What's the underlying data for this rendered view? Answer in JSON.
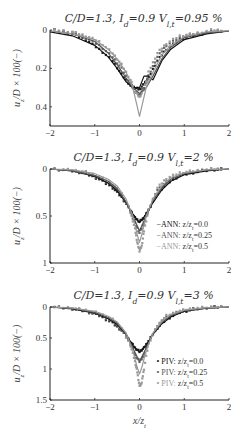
{
  "chart_data": [
    {
      "type": "line",
      "title": "C/D=1.3, I_d=0.9 V_l,t=0.95 %",
      "xlabel": "",
      "ylabel": "u_z/D × 100(−)",
      "xlim": [
        -2,
        2
      ],
      "ylim": [
        0,
        0.5
      ],
      "y_inverted": true,
      "xticks": [
        "-2",
        "-1",
        "0",
        "1",
        "2"
      ],
      "yticks": [
        "0",
        "0.2",
        "0.4"
      ],
      "ytick_values": [
        0,
        0.2,
        0.4
      ],
      "legend": [],
      "series": [
        {
          "name": "ANN: z/z_t=0.0",
          "style": "line",
          "color": "#111111",
          "x": [
            -2,
            -1.5,
            -1,
            -0.7,
            -0.5,
            -0.3,
            -0.15,
            0,
            0.1,
            0.2,
            0.3,
            0.5,
            0.7,
            1,
            1.5,
            2
          ],
          "y": [
            0.01,
            0.03,
            0.08,
            0.14,
            0.2,
            0.27,
            0.3,
            0.3,
            0.24,
            0.24,
            0.26,
            0.16,
            0.1,
            0.05,
            0.02,
            0.005
          ]
        },
        {
          "name": "ANN: z/z_t=0.25",
          "style": "line",
          "color": "#555555",
          "x": [
            -2,
            -1.5,
            -1,
            -0.7,
            -0.5,
            -0.3,
            -0.15,
            0,
            0.15,
            0.3,
            0.5,
            0.7,
            1,
            1.5,
            2
          ],
          "y": [
            0.005,
            0.02,
            0.06,
            0.12,
            0.18,
            0.25,
            0.3,
            0.33,
            0.3,
            0.24,
            0.15,
            0.09,
            0.04,
            0.015,
            0.005
          ]
        },
        {
          "name": "ANN: z/z_t=0.5",
          "style": "line",
          "color": "#999999",
          "x": [
            -2,
            -1.5,
            -1,
            -0.7,
            -0.5,
            -0.3,
            -0.15,
            -0.05,
            0,
            0.05,
            0.15,
            0.3,
            0.5,
            0.7,
            1,
            1.5,
            2
          ],
          "y": [
            0.005,
            0.02,
            0.05,
            0.1,
            0.15,
            0.22,
            0.3,
            0.4,
            0.45,
            0.4,
            0.3,
            0.22,
            0.13,
            0.08,
            0.035,
            0.01,
            0.003
          ]
        },
        {
          "name": "PIV: z/z_t=0.0",
          "style": "marker",
          "color": "#222222",
          "x": [
            -1.9,
            -1.5,
            -1.2,
            -0.9,
            -0.6,
            -0.4,
            -0.2,
            -0.1,
            0,
            0.1,
            0.2,
            0.4,
            0.6,
            0.9,
            1.2,
            1.6,
            1.9
          ],
          "y": [
            0.0,
            0.02,
            0.05,
            0.1,
            0.16,
            0.23,
            0.29,
            0.3,
            0.31,
            0.28,
            0.25,
            0.16,
            0.1,
            0.05,
            0.03,
            0.01,
            0.0
          ]
        },
        {
          "name": "PIV: z/z_t=0.25",
          "style": "marker",
          "color": "#666666",
          "x": [
            -1.9,
            -1.5,
            -1.2,
            -0.9,
            -0.6,
            -0.4,
            -0.2,
            -0.1,
            0,
            0.1,
            0.2,
            0.4,
            0.6,
            0.9,
            1.2,
            1.6,
            1.9
          ],
          "y": [
            0.0,
            0.01,
            0.04,
            0.08,
            0.14,
            0.2,
            0.28,
            0.32,
            0.34,
            0.3,
            0.24,
            0.14,
            0.08,
            0.04,
            0.02,
            0.01,
            0.0
          ]
        },
        {
          "name": "PIV: z/z_t=0.5",
          "style": "marker",
          "color": "#9a9a9a",
          "x": [
            -1.9,
            -1.5,
            -1.2,
            -0.9,
            -0.6,
            -0.4,
            -0.2,
            -0.1,
            0,
            0.1,
            0.2,
            0.4,
            0.6,
            0.9,
            1.2,
            1.6,
            1.9
          ],
          "y": [
            0.0,
            0.01,
            0.03,
            0.06,
            0.12,
            0.18,
            0.26,
            0.32,
            0.35,
            0.31,
            0.22,
            0.12,
            0.07,
            0.03,
            0.02,
            0.0,
            0.0
          ]
        }
      ]
    },
    {
      "type": "line",
      "title": "C/D=1.3, I_d=0.9 V_l,t=2 %",
      "xlabel": "",
      "ylabel": "u_z/D × 100(−)",
      "xlim": [
        -2,
        2
      ],
      "ylim": [
        0,
        1
      ],
      "y_inverted": true,
      "xticks": [
        "-2",
        "-1",
        "0",
        "1",
        "2"
      ],
      "yticks": [
        "0",
        "0.5",
        "1"
      ],
      "ytick_values": [
        0,
        0.5,
        1
      ],
      "legend": [
        "ANN: z/z_t=0.0",
        "ANN: z/z_t=0.25",
        "ANN: z/z_t=0.5"
      ],
      "series": [
        {
          "name": "ANN: z/z_t=0.0",
          "style": "line",
          "color": "#111111",
          "x": [
            -2,
            -1.5,
            -1,
            -0.7,
            -0.5,
            -0.3,
            -0.15,
            0,
            0.15,
            0.3,
            0.5,
            0.7,
            1,
            1.5,
            2
          ],
          "y": [
            0.0,
            0.02,
            0.08,
            0.15,
            0.23,
            0.36,
            0.48,
            0.57,
            0.48,
            0.36,
            0.22,
            0.13,
            0.06,
            0.02,
            0.0
          ]
        },
        {
          "name": "ANN: z/z_t=0.25",
          "style": "line",
          "color": "#555555",
          "x": [
            -2,
            -1.5,
            -1,
            -0.7,
            -0.5,
            -0.3,
            -0.15,
            0,
            0.15,
            0.3,
            0.5,
            0.7,
            1,
            1.5,
            2
          ],
          "y": [
            0.0,
            0.02,
            0.07,
            0.13,
            0.21,
            0.35,
            0.5,
            0.66,
            0.5,
            0.34,
            0.2,
            0.11,
            0.05,
            0.01,
            0.0
          ]
        },
        {
          "name": "ANN: z/z_t=0.5",
          "style": "line",
          "color": "#999999",
          "x": [
            -2,
            -1.5,
            -1,
            -0.7,
            -0.5,
            -0.3,
            -0.15,
            -0.05,
            0,
            0.05,
            0.15,
            0.3,
            0.5,
            0.7,
            1,
            1.5,
            2
          ],
          "y": [
            0.0,
            0.01,
            0.05,
            0.11,
            0.18,
            0.32,
            0.5,
            0.7,
            0.78,
            0.7,
            0.5,
            0.32,
            0.18,
            0.09,
            0.04,
            0.01,
            0.0
          ]
        },
        {
          "name": "PIV: z/z_t=0.0",
          "style": "marker",
          "color": "#222222",
          "x": [
            -1.9,
            -1.5,
            -1.2,
            -0.9,
            -0.6,
            -0.4,
            -0.2,
            -0.1,
            0,
            0.1,
            0.2,
            0.4,
            0.6,
            0.9,
            1.2,
            1.6,
            1.9
          ],
          "y": [
            0.0,
            0.02,
            0.05,
            0.11,
            0.2,
            0.3,
            0.44,
            0.52,
            0.56,
            0.52,
            0.44,
            0.26,
            0.16,
            0.07,
            0.04,
            0.01,
            0.0
          ]
        },
        {
          "name": "PIV: z/z_t=0.25",
          "style": "marker",
          "color": "#666666",
          "x": [
            -1.9,
            -1.5,
            -1.2,
            -0.9,
            -0.6,
            -0.4,
            -0.2,
            -0.1,
            0,
            0.1,
            0.2,
            0.4,
            0.6,
            0.9,
            1.2,
            1.6,
            1.9
          ],
          "y": [
            0.0,
            0.02,
            0.04,
            0.1,
            0.18,
            0.28,
            0.46,
            0.58,
            0.68,
            0.58,
            0.44,
            0.22,
            0.14,
            0.06,
            0.03,
            0.0,
            0.0
          ]
        },
        {
          "name": "PIV: z/z_t=0.5",
          "style": "marker",
          "color": "#9a9a9a",
          "x": [
            -1.9,
            -1.5,
            -1.2,
            -0.9,
            -0.6,
            -0.4,
            -0.2,
            -0.1,
            -0.05,
            0,
            0.05,
            0.1,
            0.2,
            0.4,
            0.6,
            0.9,
            1.2,
            1.6,
            1.9
          ],
          "y": [
            0.0,
            0.01,
            0.03,
            0.08,
            0.16,
            0.26,
            0.46,
            0.64,
            0.78,
            0.87,
            0.82,
            0.66,
            0.44,
            0.2,
            0.1,
            0.04,
            0.02,
            0.0,
            0.0
          ]
        }
      ]
    },
    {
      "type": "line",
      "title": "C/D=1.3, I_d=0.9 V_l,t=3 %",
      "xlabel": "x/z_t",
      "ylabel": "u_z/D × 100(−)",
      "xlim": [
        -2,
        2
      ],
      "ylim": [
        0,
        1.5
      ],
      "y_inverted": true,
      "xticks": [
        "-2",
        "-1",
        "0",
        "1",
        "2"
      ],
      "yticks": [
        "0",
        "0.5",
        "1",
        "1.5"
      ],
      "ytick_values": [
        0,
        0.5,
        1,
        1.5
      ],
      "legend": [
        "PIV: z/z_t=0.0",
        "PIV: z/z_t=0.25",
        "PIV: z/z_t=0.5"
      ],
      "series": [
        {
          "name": "ANN: z/z_t=0.0",
          "style": "line",
          "color": "#111111",
          "x": [
            -2,
            -1.5,
            -1,
            -0.7,
            -0.5,
            -0.3,
            -0.15,
            0,
            0.15,
            0.3,
            0.5,
            0.7,
            1,
            1.5,
            2
          ],
          "y": [
            0.0,
            0.03,
            0.1,
            0.19,
            0.28,
            0.44,
            0.62,
            0.73,
            0.62,
            0.44,
            0.27,
            0.16,
            0.07,
            0.02,
            0.0
          ]
        },
        {
          "name": "ANN: z/z_t=0.25",
          "style": "line",
          "color": "#555555",
          "x": [
            -2,
            -1.5,
            -1,
            -0.7,
            -0.5,
            -0.3,
            -0.15,
            0,
            0.15,
            0.3,
            0.5,
            0.7,
            1,
            1.5,
            2
          ],
          "y": [
            0.0,
            0.02,
            0.09,
            0.17,
            0.26,
            0.43,
            0.66,
            0.88,
            0.66,
            0.43,
            0.25,
            0.14,
            0.06,
            0.02,
            0.0
          ]
        },
        {
          "name": "ANN: z/z_t=0.5",
          "style": "line",
          "color": "#999999",
          "x": [
            -2,
            -1.5,
            -1,
            -0.7,
            -0.5,
            -0.3,
            -0.15,
            -0.05,
            0,
            0.05,
            0.15,
            0.3,
            0.5,
            0.7,
            1,
            1.5,
            2
          ],
          "y": [
            0.0,
            0.02,
            0.07,
            0.15,
            0.24,
            0.42,
            0.7,
            0.98,
            1.08,
            0.98,
            0.7,
            0.42,
            0.23,
            0.12,
            0.05,
            0.01,
            0.0
          ]
        },
        {
          "name": "PIV: z/z_t=0.0",
          "style": "marker",
          "color": "#222222",
          "x": [
            -1.9,
            -1.5,
            -1.2,
            -0.9,
            -0.6,
            -0.4,
            -0.2,
            -0.1,
            0,
            0.1,
            0.2,
            0.4,
            0.6,
            0.9,
            1.2,
            1.6,
            1.9
          ],
          "y": [
            0.0,
            0.03,
            0.07,
            0.14,
            0.26,
            0.38,
            0.56,
            0.66,
            0.72,
            0.66,
            0.55,
            0.34,
            0.2,
            0.09,
            0.04,
            0.0,
            0.0
          ]
        },
        {
          "name": "PIV: z/z_t=0.25",
          "style": "marker",
          "color": "#666666",
          "x": [
            -1.9,
            -1.5,
            -1.2,
            -0.9,
            -0.6,
            -0.4,
            -0.2,
            -0.1,
            0,
            0.1,
            0.2,
            0.4,
            0.6,
            0.9,
            1.2,
            1.6,
            1.9
          ],
          "y": [
            0.0,
            0.02,
            0.06,
            0.13,
            0.24,
            0.37,
            0.6,
            0.78,
            0.88,
            0.78,
            0.58,
            0.3,
            0.16,
            0.07,
            0.03,
            0.0,
            0.0
          ]
        },
        {
          "name": "PIV: z/z_t=0.5",
          "style": "marker",
          "color": "#9a9a9a",
          "x": [
            -1.9,
            -1.5,
            -1.2,
            -0.9,
            -0.6,
            -0.4,
            -0.2,
            -0.1,
            -0.05,
            0,
            0.05,
            0.1,
            0.2,
            0.4,
            0.6,
            0.9,
            1.2,
            1.6,
            1.9
          ],
          "y": [
            0.0,
            0.02,
            0.05,
            0.1,
            0.2,
            0.34,
            0.62,
            0.88,
            1.05,
            1.28,
            1.22,
            1.0,
            0.6,
            0.3,
            0.14,
            0.06,
            0.02,
            0.0,
            0.0
          ]
        }
      ]
    }
  ],
  "panels": [
    {
      "title_main": "C/D=1.3, I",
      "title_sub1": "d",
      "title_mid": "=0.9 V",
      "title_sub2": "l,t",
      "title_end": "=0.95 %",
      "ylabel": "u_z/D × 100(−)"
    },
    {
      "title_main": "C/D=1.3, I",
      "title_sub1": "d",
      "title_mid": "=0.9 V",
      "title_sub2": "l,t",
      "title_end": "=2 %",
      "ylabel": "u_z/D × 100(−)",
      "legend_prefix": "−ANN: "
    },
    {
      "title_main": "C/D=1.3, I",
      "title_sub1": "d",
      "title_mid": "=0.9 V",
      "title_sub2": "l,t",
      "title_end": "=3 %",
      "ylabel": "u_z/D × 100(−)",
      "legend_prefix": "• PIV: ",
      "xlabel": "x/z_t"
    }
  ],
  "layout": {
    "axes": [
      {
        "left": 50,
        "right": 229,
        "top": 30,
        "bottom": 126
      },
      {
        "left": 50,
        "right": 229,
        "top": 169,
        "bottom": 263
      },
      {
        "left": 50,
        "right": 229,
        "top": 307,
        "bottom": 400
      }
    ]
  }
}
